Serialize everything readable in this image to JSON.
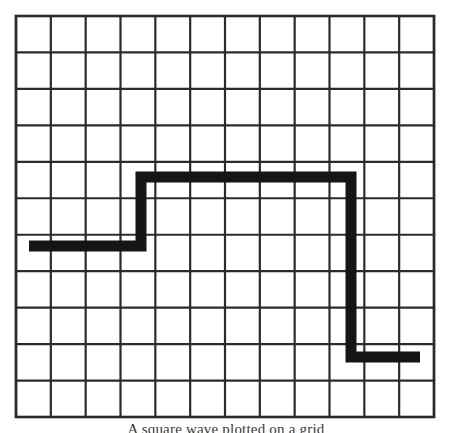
{
  "figure": {
    "kind": "graph-paper-waveform",
    "background_color": "#ffffff",
    "caption": "A square wave plotted on a grid",
    "grid": {
      "label": "graph-paper-grid",
      "left": 16,
      "top": 16,
      "right": 434,
      "bottom": 417,
      "columns": 12,
      "rows": 11,
      "cell_width": 34.83,
      "cell_height": 36.45,
      "line_color": "#2b2b2b",
      "line_width": 2.2,
      "border_width": 2.6
    },
    "waveform": {
      "label": "square-wave-trace",
      "stroke_color": "#151515",
      "stroke_width": 11,
      "levels": {
        "low_left_y": 246,
        "high_y": 177,
        "low_right_y": 357
      },
      "points": [
        [
          29,
          246
        ],
        [
          141,
          246
        ],
        [
          141,
          177
        ],
        [
          351,
          177
        ],
        [
          351,
          357
        ],
        [
          420,
          357
        ]
      ],
      "segments": [
        {
          "name": "low-left-plateau",
          "x1": 29,
          "y1": 246,
          "x2": 141,
          "y2": 246,
          "orientation": "horizontal"
        },
        {
          "name": "rising-edge",
          "x1": 141,
          "y1": 246,
          "x2": 141,
          "y2": 177,
          "orientation": "vertical"
        },
        {
          "name": "high-plateau",
          "x1": 141,
          "y1": 177,
          "x2": 351,
          "y2": 177,
          "orientation": "horizontal"
        },
        {
          "name": "falling-edge",
          "x1": 351,
          "y1": 177,
          "x2": 351,
          "y2": 357,
          "orientation": "vertical"
        },
        {
          "name": "low-right-plateau",
          "x1": 351,
          "y1": 357,
          "x2": 420,
          "y2": 357,
          "orientation": "horizontal"
        }
      ]
    }
  },
  "chart_data": {
    "type": "line",
    "title": "",
    "xlabel": "",
    "ylabel": "",
    "grid": true,
    "legend": "none",
    "x": [
      0.37,
      3.59,
      3.59,
      9.62,
      9.62,
      11.6
    ],
    "y": [
      4.69,
      4.69,
      6.58,
      6.58,
      1.65,
      1.65
    ],
    "xlim": [
      0,
      12
    ],
    "ylim": [
      0,
      11
    ],
    "series": [
      {
        "name": "square wave",
        "values": [
          4.69,
          4.69,
          6.58,
          6.58,
          1.65,
          1.65
        ]
      }
    ]
  }
}
